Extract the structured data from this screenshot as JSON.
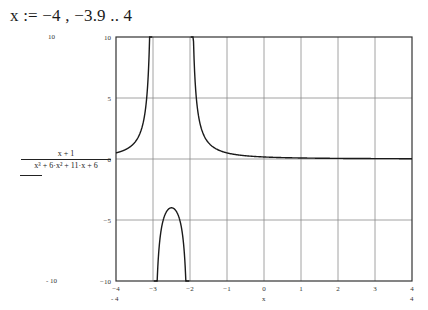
{
  "definition": {
    "text": "x := −4 , −3.9 .. 4"
  },
  "y_axis_expression": {
    "numerator": "x + 1",
    "denominator": "x³ + 6·x² + 11·x + 6"
  },
  "extra_labels": {
    "ymax_outside": "10",
    "ymin_outside": "- 10",
    "xmin_under": "- 4",
    "xmax_under": "4",
    "x_var": "x"
  },
  "colors": {
    "curve": "#1a1a1a",
    "grid": "#8c8c8c",
    "frame": "#333333"
  },
  "chart_data": {
    "type": "line",
    "title": "",
    "xlabel": "x",
    "ylabel": "(x + 1) / (x³ + 6·x² + 11·x + 6)",
    "xlim": [
      -4,
      4
    ],
    "ylim": [
      -10,
      10
    ],
    "grid": true,
    "x_ticks": [
      "-4",
      "-3",
      "-2",
      "-1",
      "0",
      "1",
      "2",
      "3",
      "4"
    ],
    "y_ticks": [
      "10",
      "5",
      "0",
      "-5",
      "-10"
    ],
    "x_start": -4,
    "x_step": 0.1,
    "x_end": 4,
    "series": [
      {
        "name": "(x+1)/(x^3+6x^2+11x+6)",
        "x": [
          -4.0,
          -3.9,
          -3.8,
          -3.7,
          -3.6,
          -3.5,
          -3.4,
          -3.3,
          -3.2,
          -3.1,
          -3.0,
          -2.9,
          -2.8,
          -2.7,
          -2.6,
          -2.5,
          -2.4,
          -2.3,
          -2.2,
          -2.1,
          -2.0,
          -1.9,
          -1.8,
          -1.7,
          -1.6,
          -1.5,
          -1.4,
          -1.3,
          -1.2,
          -1.1,
          -1.0,
          -0.9,
          -0.8,
          -0.7,
          -0.6,
          -0.5,
          -0.4,
          -0.3,
          -0.2,
          -0.1,
          0.0,
          0.1,
          0.2,
          0.3,
          0.4,
          0.5,
          0.6,
          0.7,
          0.8,
          0.9,
          1.0,
          1.1,
          1.2,
          1.3,
          1.4,
          1.5,
          1.6,
          1.7,
          1.8,
          1.9,
          2.0,
          2.1,
          2.2,
          2.3,
          2.4,
          2.5,
          2.6,
          2.7,
          2.8,
          2.9,
          3.0,
          3.1,
          3.2,
          3.3,
          3.4,
          3.5,
          3.6,
          3.7,
          3.8,
          3.9,
          4.0
        ],
        "y": [
          0.5,
          0.585,
          0.694,
          0.84,
          1.042,
          1.333,
          1.786,
          2.564,
          4.167,
          9.091,
          null,
          -11.111,
          -6.25,
          -4.762,
          -4.167,
          -4.0,
          -4.167,
          -4.762,
          -6.25,
          -11.111,
          null,
          9.091,
          4.167,
          2.564,
          1.786,
          1.333,
          1.042,
          0.84,
          0.694,
          0.585,
          null,
          0.435,
          0.379,
          0.333,
          0.294,
          0.267,
          0.24,
          0.217,
          0.198,
          0.18,
          0.167,
          0.154,
          0.142,
          0.132,
          0.123,
          0.114,
          0.107,
          0.1,
          0.094,
          0.088,
          0.083,
          0.079,
          0.074,
          0.07,
          0.067,
          0.063,
          0.06,
          0.057,
          0.054,
          0.052,
          0.05,
          0.048,
          0.046,
          0.044,
          0.042,
          0.04,
          0.038,
          0.037,
          0.035,
          0.034,
          0.033,
          0.032,
          0.031,
          0.029,
          0.028,
          0.027,
          0.026,
          0.025,
          0.025,
          0.024,
          0.024
        ]
      }
    ]
  }
}
